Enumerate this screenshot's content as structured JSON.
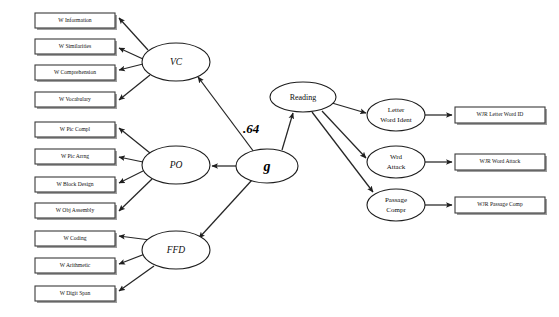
{
  "diagram": {
    "type": "path-diagram",
    "canvas": {
      "width": 559,
      "height": 317
    },
    "colors": {
      "background": "#ffffff",
      "stroke": "#262626",
      "box_stroke": "#3a3a3a",
      "box_shadow": "#8d8d8d",
      "text": "#0d0d0d"
    }
  },
  "indicators_wisc": [
    {
      "id": "w-information",
      "label": "W Information",
      "x": 35,
      "y": 13,
      "w": 80,
      "h": 15
    },
    {
      "id": "w-similarities",
      "label": "W Similarities",
      "x": 35,
      "y": 39,
      "w": 80,
      "h": 15
    },
    {
      "id": "w-comprehension",
      "label": "W Comprehension",
      "x": 35,
      "y": 65,
      "w": 80,
      "h": 15
    },
    {
      "id": "w-vocabulary",
      "label": "W Vocabulary",
      "x": 35,
      "y": 92,
      "w": 80,
      "h": 15
    },
    {
      "id": "w-pic-compl",
      "label": "W Pic Compl",
      "x": 35,
      "y": 122,
      "w": 80,
      "h": 15
    },
    {
      "id": "w-pic-arrng",
      "label": "W Pic Arrng",
      "x": 35,
      "y": 149,
      "w": 80,
      "h": 15
    },
    {
      "id": "w-block-design",
      "label": "W Block Design",
      "x": 35,
      "y": 177,
      "w": 80,
      "h": 15
    },
    {
      "id": "w-obj-assembly",
      "label": "W Obj Assembly",
      "x": 35,
      "y": 203,
      "w": 80,
      "h": 15
    },
    {
      "id": "w-coding",
      "label": "W Coding",
      "x": 35,
      "y": 231,
      "w": 80,
      "h": 15
    },
    {
      "id": "w-arithmetic",
      "label": "W Arithmetic",
      "x": 35,
      "y": 258,
      "w": 80,
      "h": 15
    },
    {
      "id": "w-digit-span",
      "label": "W Digit Span",
      "x": 35,
      "y": 286,
      "w": 80,
      "h": 15
    }
  ],
  "latent_wisc": [
    {
      "id": "vc",
      "label": "VC",
      "cx": 176,
      "cy": 62,
      "rx": 34,
      "ry": 19
    },
    {
      "id": "po",
      "label": "PO",
      "cx": 176,
      "cy": 165,
      "rx": 34,
      "ry": 19
    },
    {
      "id": "ffd",
      "label": "FFD",
      "cx": 176,
      "cy": 250,
      "rx": 34,
      "ry": 19
    }
  ],
  "general_factor": {
    "id": "g",
    "label": "g",
    "cx": 267,
    "cy": 166,
    "rx": 31,
    "ry": 17
  },
  "reading_factor": {
    "id": "reading",
    "label": "Reading",
    "cx": 303,
    "cy": 97,
    "rx": 33,
    "ry": 15
  },
  "path_coefficient": {
    "id": "g-to-reading",
    "value": ".64",
    "x": 251,
    "y": 130,
    "from": "g",
    "to": "Reading"
  },
  "latent_reading": [
    {
      "id": "letter-word-ident",
      "line1": "Letter",
      "line2": "Word Ident",
      "cx": 396,
      "cy": 115,
      "rx": 29,
      "ry": 16
    },
    {
      "id": "wrd-attack",
      "line1": "Wrd",
      "line2": "Attack",
      "cx": 396,
      "cy": 162,
      "rx": 29,
      "ry": 16
    },
    {
      "id": "passage-compr",
      "line1": "Passage",
      "line2": "Compr",
      "cx": 396,
      "cy": 205,
      "rx": 29,
      "ry": 16
    }
  ],
  "indicators_wjr": [
    {
      "id": "wjr-letter-word-id",
      "label": "WJR Letter Word ID",
      "x": 455,
      "y": 107,
      "w": 90,
      "h": 16
    },
    {
      "id": "wjr-word-attack",
      "label": "WJR Word Attack",
      "x": 455,
      "y": 154,
      "w": 90,
      "h": 16
    },
    {
      "id": "wjr-passage-comp",
      "label": "WJR Passage Comp",
      "x": 455,
      "y": 197,
      "w": 90,
      "h": 16
    }
  ],
  "edges": [
    {
      "id": "vc-to-w-information",
      "from": "vc",
      "to": "w-information"
    },
    {
      "id": "vc-to-w-similarities",
      "from": "vc",
      "to": "w-similarities"
    },
    {
      "id": "vc-to-w-comprehension",
      "from": "vc",
      "to": "w-comprehension"
    },
    {
      "id": "vc-to-w-vocabulary",
      "from": "vc",
      "to": "w-vocabulary"
    },
    {
      "id": "po-to-w-pic-compl",
      "from": "po",
      "to": "w-pic-compl"
    },
    {
      "id": "po-to-w-pic-arrng",
      "from": "po",
      "to": "w-pic-arrng"
    },
    {
      "id": "po-to-w-block-design",
      "from": "po",
      "to": "w-block-design"
    },
    {
      "id": "po-to-w-obj-assembly",
      "from": "po",
      "to": "w-obj-assembly"
    },
    {
      "id": "ffd-to-w-coding",
      "from": "ffd",
      "to": "w-coding"
    },
    {
      "id": "ffd-to-w-arithmetic",
      "from": "ffd",
      "to": "w-arithmetic"
    },
    {
      "id": "ffd-to-w-digit-span",
      "from": "ffd",
      "to": "w-digit-span"
    },
    {
      "id": "g-to-vc",
      "from": "g",
      "to": "vc"
    },
    {
      "id": "g-to-po",
      "from": "g",
      "to": "po"
    },
    {
      "id": "g-to-ffd",
      "from": "g",
      "to": "ffd"
    },
    {
      "id": "g-to-reading",
      "from": "g",
      "to": "reading"
    },
    {
      "id": "reading-to-letter-word-ident",
      "from": "reading",
      "to": "letter-word-ident"
    },
    {
      "id": "reading-to-wrd-attack",
      "from": "reading",
      "to": "wrd-attack"
    },
    {
      "id": "reading-to-passage-compr",
      "from": "reading",
      "to": "passage-compr"
    },
    {
      "id": "letter-word-ident-to-wjr",
      "from": "letter-word-ident",
      "to": "wjr-letter-word-id"
    },
    {
      "id": "wrd-attack-to-wjr",
      "from": "wrd-attack",
      "to": "wjr-word-attack"
    },
    {
      "id": "passage-compr-to-wjr",
      "from": "passage-compr",
      "to": "wjr-passage-comp"
    }
  ]
}
